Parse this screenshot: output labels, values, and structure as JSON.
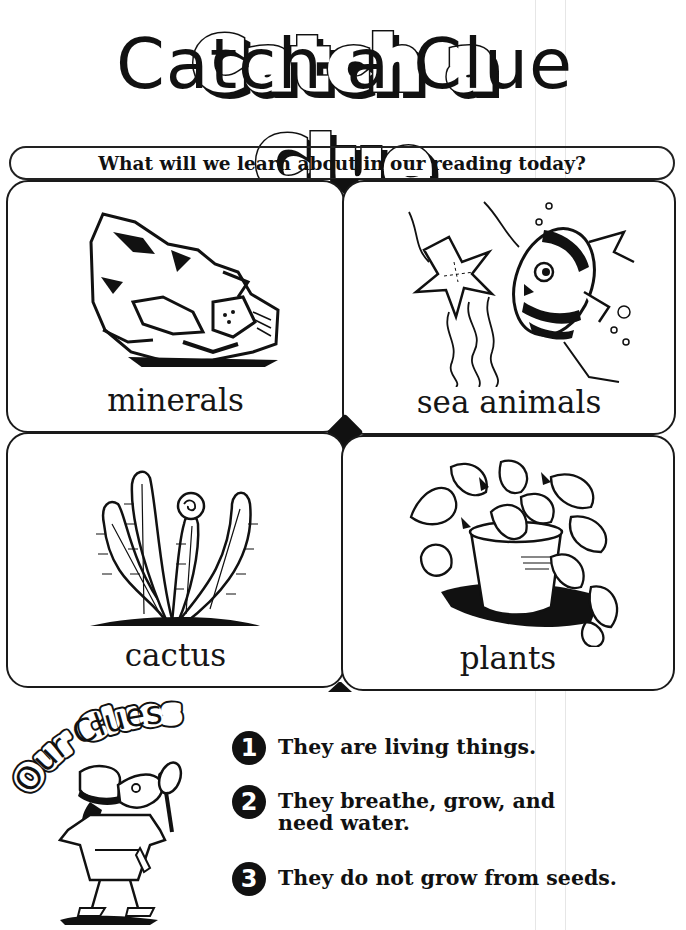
{
  "worksheet": {
    "title": "Catch a Clue",
    "question": "What will we learn about in our reading today?"
  },
  "cards": [
    {
      "label": "minerals",
      "illustration": "rock-mineral"
    },
    {
      "label": "sea animals",
      "illustration": "starfish-and-fish"
    },
    {
      "label": "cactus",
      "illustration": "cactus-with-flower"
    },
    {
      "label": "plants",
      "illustration": "potted-plant"
    }
  ],
  "clues_section": {
    "heading": "Our Clues",
    "mascot": "detective-dog-with-magnifying-glass",
    "clues": [
      {
        "number": "1",
        "text": "They are living things."
      },
      {
        "number": "2",
        "text": "They breathe, grow, and need water."
      },
      {
        "number": "3",
        "text": "They do not grow from seeds."
      }
    ]
  },
  "colors": {
    "ink": "#111111",
    "paper": "#ffffff"
  }
}
